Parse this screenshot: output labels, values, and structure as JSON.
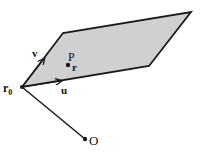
{
  "diagram": {
    "colors": {
      "plane_fill": "#d0d0d0",
      "stroke": "#1a1a1a",
      "background": "#ffffff"
    },
    "plane": {
      "vertices": [
        [
          22,
          87
        ],
        [
          63,
          33
        ],
        [
          191,
          12
        ],
        [
          149,
          66
        ]
      ]
    },
    "points": {
      "r0": {
        "label": "r",
        "subscript": "0",
        "x": 22,
        "y": 87
      },
      "P": {
        "label": "P",
        "x": 68,
        "y": 65
      },
      "O": {
        "label": "O",
        "x": 85,
        "y": 139
      }
    },
    "vectors": {
      "u": {
        "label": "u"
      },
      "v": {
        "label": "v"
      },
      "r": {
        "label": "r"
      }
    }
  }
}
